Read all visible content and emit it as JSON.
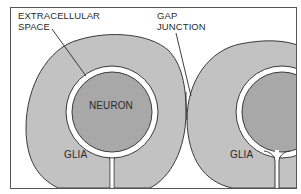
{
  "diagram": {
    "colors": {
      "background": "#ffffff",
      "frame": "#555555",
      "glia": "#c2c2c2",
      "neuron": "#a8a8a8",
      "outline": "#3a3a3a",
      "extracellular_space": "#ffffff"
    },
    "labels": {
      "extracellular_space_line1": "EXTRACELLULAR",
      "extracellular_space_line2": "SPACE",
      "gap_junction_line1": "GAP",
      "gap_junction_line2": "JUNCTION",
      "neuron": "NEURON",
      "glia_left": "GLIA",
      "glia_right": "GLIA"
    }
  }
}
